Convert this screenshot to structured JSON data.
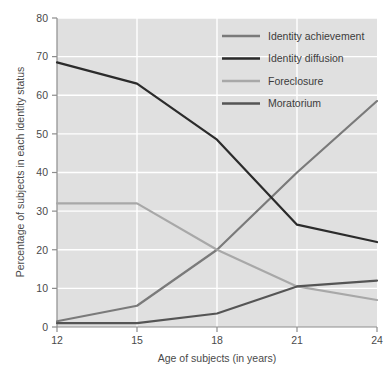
{
  "chart_data": {
    "type": "line",
    "title": "",
    "xlabel": "Age of subjects (in years)",
    "ylabel": "Percentage of subjects in each identity status",
    "x": [
      12,
      15,
      18,
      21,
      24
    ],
    "xtick_labels": [
      "12",
      "15",
      "18",
      "21",
      "24"
    ],
    "ytick_labels": [
      "0",
      "10",
      "20",
      "30",
      "40",
      "50",
      "60",
      "70",
      "80"
    ],
    "ytick_values": [
      0,
      10,
      20,
      30,
      40,
      50,
      60,
      70,
      80
    ],
    "xlim": [
      12,
      24
    ],
    "ylim": [
      0,
      80
    ],
    "grid": true,
    "grid_color": "#ffffff",
    "plot_background": "#e0e0e0",
    "figure_background": "#ffffff",
    "legend_position": "top-right",
    "series": [
      {
        "name": "Identity achievement",
        "color": "#7a7a7a",
        "values": [
          1.5,
          5.5,
          20.0,
          40.0,
          58.5
        ]
      },
      {
        "name": "Identity diffusion",
        "color": "#2b2b2b",
        "values": [
          68.5,
          63.0,
          48.5,
          26.5,
          22.0
        ]
      },
      {
        "name": "Foreclosure",
        "color": "#a8a8a8",
        "values": [
          32.0,
          32.0,
          20.0,
          10.5,
          7.0
        ]
      },
      {
        "name": "Moratorium",
        "color": "#555555",
        "values": [
          1.0,
          1.0,
          3.5,
          10.5,
          12.0
        ]
      }
    ]
  },
  "legend": {
    "items": [
      {
        "label": "Identity achievement"
      },
      {
        "label": "Identity diffusion"
      },
      {
        "label": "Foreclosure"
      },
      {
        "label": "Moratorium"
      }
    ]
  },
  "axes": {
    "x_title": "Age of subjects (in years)",
    "y_title": "Percentage of subjects in each identity status"
  }
}
